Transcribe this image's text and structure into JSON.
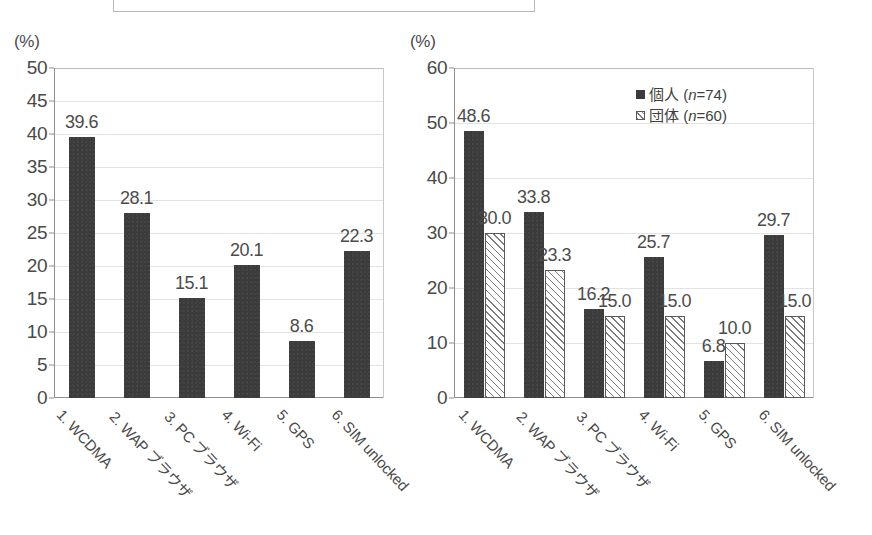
{
  "document": {
    "top_box": {
      "present": true,
      "content": ""
    }
  },
  "colors": {
    "series_individual": "#3b3b3b",
    "series_organization": "#ffffff",
    "hatch_stroke": "#7d7d7d",
    "axis": "#8f8f8f",
    "grid": "#e3e3e3",
    "text": "#4a4a4a"
  },
  "categories": [
    "1. WCDMA",
    "2. WAP ブラウザ",
    "3. PC ブラウザ",
    "4. Wi-Fi",
    "5. GPS",
    "6. SIM unlocked"
  ],
  "chart_data": [
    {
      "id": "left-chart",
      "type": "bar",
      "title": "",
      "xlabel": "",
      "ylabel": "(%)",
      "unit_label": "(%)",
      "ylim": [
        0,
        50
      ],
      "yticks": [
        0,
        5,
        10,
        15,
        20,
        25,
        30,
        35,
        40,
        45,
        50
      ],
      "grid": true,
      "legend": null,
      "categories": [
        "1. WCDMA",
        "2. WAP ブラウザ",
        "3. PC ブラウザ",
        "4. Wi-Fi",
        "5. GPS",
        "6. SIM unlocked"
      ],
      "series": [
        {
          "name": "",
          "style": "solid",
          "values": [
            39.6,
            28.1,
            15.1,
            20.1,
            8.6,
            22.3
          ],
          "labels": [
            "39.6",
            "28.1",
            "15.1",
            "20.1",
            "8.6",
            "22.3"
          ]
        }
      ]
    },
    {
      "id": "right-chart",
      "type": "bar",
      "title": "",
      "xlabel": "",
      "ylabel": "(%)",
      "unit_label": "(%)",
      "ylim": [
        0,
        60
      ],
      "yticks": [
        0,
        10,
        20,
        30,
        40,
        50,
        60
      ],
      "grid": true,
      "legend_position": "top-right",
      "categories": [
        "1. WCDMA",
        "2. WAP ブラウザ",
        "3. PC ブラウザ",
        "4. Wi-Fi",
        "5. GPS",
        "6. SIM unlocked"
      ],
      "series": [
        {
          "name": "個人 (n=74)",
          "name_main": "個人",
          "name_n": "n",
          "name_tail": "=74)",
          "style": "solid",
          "values": [
            48.6,
            33.8,
            16.2,
            25.7,
            6.8,
            29.7
          ],
          "labels": [
            "48.6",
            "33.8",
            "16.2",
            "25.7",
            "6.8",
            "29.7"
          ]
        },
        {
          "name": "団体 (n=60)",
          "name_main": "団体",
          "name_n": "n",
          "name_tail": "=60)",
          "style": "hatch",
          "values": [
            30.0,
            23.3,
            15.0,
            15.0,
            10.0,
            15.0
          ],
          "labels": [
            "30.0",
            "23.3",
            "15.0",
            "15.0",
            "10.0",
            "15.0"
          ]
        }
      ]
    }
  ]
}
